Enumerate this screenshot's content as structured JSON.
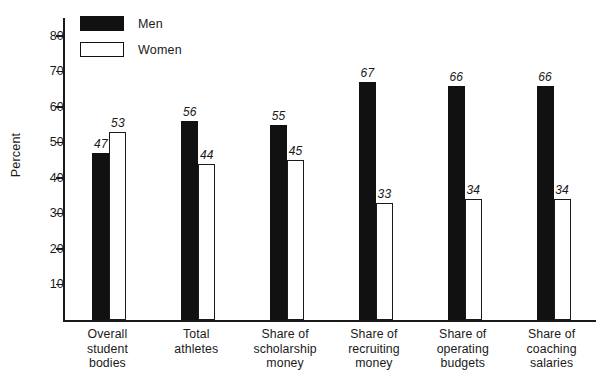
{
  "chart_data": {
    "type": "bar",
    "title": "",
    "xlabel": "",
    "ylabel": "Percent",
    "ylim": [
      0,
      85
    ],
    "ytick_labels": [
      "80",
      "70",
      "60",
      "50",
      "40",
      "30",
      "20",
      "10"
    ],
    "ytick_values": [
      80,
      70,
      60,
      50,
      40,
      30,
      20,
      10
    ],
    "grid": false,
    "legend_position": "top-left",
    "categories": [
      "Overall\nstudent\nbodies",
      "Total\nathletes",
      "Share of\nscholarship\nmoney",
      "Share of\nrecruiting\nmoney",
      "Share of\noperating\nbudgets",
      "Share of\ncoaching\nsalaries"
    ],
    "category_lines": [
      [
        "Overall",
        "student",
        "bodies"
      ],
      [
        "Total",
        "athletes"
      ],
      [
        "Share of",
        "scholarship",
        "money"
      ],
      [
        "Share of",
        "recruiting",
        "money"
      ],
      [
        "Share of",
        "operating",
        "budgets"
      ],
      [
        "Share of",
        "coaching",
        "salaries"
      ]
    ],
    "series": [
      {
        "name": "Men",
        "color": "#111111",
        "values": [
          47,
          56,
          55,
          67,
          66,
          66
        ]
      },
      {
        "name": "Women",
        "color": "#ffffff",
        "values": [
          53,
          44,
          45,
          33,
          34,
          34
        ]
      }
    ]
  },
  "legend": {
    "items": [
      {
        "label": "Men",
        "style": "filled"
      },
      {
        "label": "Women",
        "style": "outline"
      }
    ]
  },
  "axis": {
    "y_title": "Percent"
  }
}
